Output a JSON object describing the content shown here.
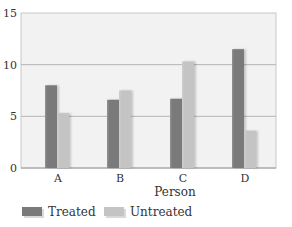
{
  "chart_data": {
    "type": "bar",
    "title": "",
    "xlabel": "Person",
    "ylabel": "",
    "categories": [
      "A",
      "B",
      "C",
      "D"
    ],
    "series": [
      {
        "name": "Treated",
        "values": [
          8.0,
          6.6,
          6.7,
          11.5
        ],
        "color": "#7a7a7a"
      },
      {
        "name": "Untreated",
        "values": [
          5.3,
          7.5,
          10.3,
          3.6
        ],
        "color": "#c4c4c4"
      }
    ],
    "ylim": [
      0,
      15
    ],
    "yticks": [
      0,
      5,
      10,
      15
    ],
    "grid": true,
    "legend_position": "bottom-left"
  },
  "colors": {
    "plot_background": "#f2f2f2",
    "grid_line": "#b5b5b5",
    "treated": "#7a7a7a",
    "untreated": "#c4c4c4"
  }
}
